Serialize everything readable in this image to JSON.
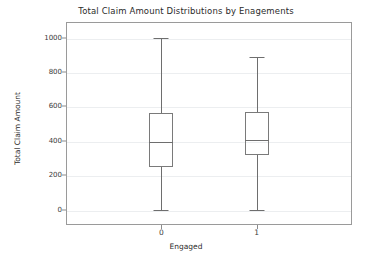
{
  "chart_data": {
    "type": "box",
    "title": "Total Claim Amount Distributions by Enagements",
    "xlabel": "Engaged",
    "ylabel": "Total Claim Amount",
    "categories": [
      "0",
      "1"
    ],
    "xtick_labels": [
      "0",
      "1"
    ],
    "ytick_labels": [
      "0",
      "200",
      "400",
      "600",
      "800",
      "1000"
    ],
    "yticks": [
      0,
      200,
      400,
      600,
      800,
      1000
    ],
    "ylim": [
      -88,
      1090
    ],
    "grid": true,
    "legend": "none",
    "boxes": [
      {
        "category": "0",
        "whisker_low": 0,
        "q1": 250,
        "median": 395,
        "q3": 560,
        "whisker_high": 1000,
        "outliers": []
      },
      {
        "category": "1",
        "whisker_low": 0,
        "q1": 320,
        "median": 408,
        "q3": 565,
        "whisker_high": 885,
        "outliers": []
      }
    ],
    "colors": {
      "box_edge": "#7a7a7a",
      "whisker": "#6e6e6e",
      "median": "#6e6e6e",
      "grid": "#eceef0",
      "axis": "#9a9a9a",
      "background": "#ffffff",
      "text": "#2b2b2b"
    }
  }
}
